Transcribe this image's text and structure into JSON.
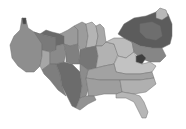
{
  "map": {
    "type": "cartogram",
    "subject": "contiguous United States",
    "color_scheme": "grayscale",
    "background": "#ffffff",
    "border_color": "#6e6e6e",
    "legend": null,
    "title": null,
    "regions": [
      {
        "name": "west-coast",
        "fill": "#8e8e8e",
        "points": "10,45 14,36 20,30 22,18 26,20 28,28 34,32 40,34 42,44 42,56 40,66 34,72 26,72 18,66 12,58"
      },
      {
        "name": "wa-tip",
        "fill": "#4a4a4a",
        "points": "22,18 26,18 26,24 23,24"
      },
      {
        "name": "northwest-interior",
        "fill": "#7a7a7a",
        "points": "34,32 40,34 48,36 56,38 56,50 50,52 42,50 42,44"
      },
      {
        "name": "nevada-utah",
        "fill": "#a6a6a6",
        "points": "42,50 50,52 50,64 42,70 40,66 42,56"
      },
      {
        "name": "mountain-north",
        "fill": "#6a6a6a",
        "points": "40,34 46,30 52,32 60,34 64,36 64,44 56,46 56,38 48,36"
      },
      {
        "name": "mountain-central",
        "fill": "#8a8a8a",
        "points": "50,52 56,50 56,46 64,44 66,54 64,62 56,64 50,64"
      },
      {
        "name": "southwest",
        "fill": "#7e7e7e",
        "points": "42,70 50,64 56,64 60,74 62,86 66,96 58,90 50,80 44,74"
      },
      {
        "name": "texas",
        "fill": "#6c6c6c",
        "points": "56,64 64,62 72,64 80,72 82,86 80,98 76,108 72,106 68,98 62,86 60,74"
      },
      {
        "name": "plains-north",
        "fill": "#9a9a9a",
        "points": "60,34 68,30 74,26 78,30 78,44 70,46 64,44 64,36"
      },
      {
        "name": "plains-central",
        "fill": "#808080",
        "points": "64,44 70,46 78,44 80,56 78,64 72,64 66,62 66,54"
      },
      {
        "name": "minnesota-iowa",
        "fill": "#9c9c9c",
        "points": "74,26 82,22 86,24 88,36 86,48 80,50 78,44 78,30"
      },
      {
        "name": "wisconsin",
        "fill": "#b4b4b4",
        "points": "86,24 92,22 96,26 98,36 96,46 88,48 86,48 88,36"
      },
      {
        "name": "illinois",
        "fill": "#767676",
        "points": "80,50 86,48 96,46 98,56 96,68 88,70 80,64 78,64 80,56"
      },
      {
        "name": "michigan",
        "fill": "#a8a8a8",
        "points": "96,26 100,24 104,28 106,42 102,46 96,46 98,36"
      },
      {
        "name": "indiana-ohio",
        "fill": "#b2b2b2",
        "points": "96,46 102,46 106,42 114,44 118,54 114,64 104,66 96,68 98,56"
      },
      {
        "name": "pennsylvania-ny-west",
        "fill": "#bcbcbc",
        "points": "106,42 114,38 124,38 132,42 134,52 126,58 118,56 114,44"
      },
      {
        "name": "northeast",
        "fill": "#5c5c5c",
        "points": "118,34 124,24 134,18 146,16 156,12 162,10 168,14 172,24 172,36 170,44 162,48 152,48 140,46 132,42 124,38"
      },
      {
        "name": "new-england-top",
        "fill": "#b8b8b8",
        "points": "156,12 160,8 166,10 168,16 162,20 156,18"
      },
      {
        "name": "ny-east",
        "fill": "#6e6e6e",
        "points": "140,24 152,22 160,26 162,36 156,40 146,38 140,32"
      },
      {
        "name": "mid-atlantic",
        "fill": "#868686",
        "points": "132,42 140,46 152,48 162,48 166,56 160,62 150,62 140,58 134,52"
      },
      {
        "name": "dc-md",
        "fill": "#3e3e3e",
        "points": "136,56 142,54 146,58 142,64 136,62"
      },
      {
        "name": "virginia",
        "fill": "#c2c2c2",
        "points": "118,56 126,58 134,52 136,56 136,62 142,64 150,62 156,66 152,72 140,74 126,74 116,72 114,64"
      },
      {
        "name": "kentucky-tennessee",
        "fill": "#a2a2a2",
        "points": "88,70 96,68 104,66 114,64 116,72 126,74 140,74 152,72 154,78 140,80 120,80 100,80 86,78"
      },
      {
        "name": "arkansas-louisiana",
        "fill": "#8c8c8c",
        "points": "80,64 88,70 86,78 88,90 86,96 80,98 82,86 80,72"
      },
      {
        "name": "deep-south",
        "fill": "#9e9e9e",
        "points": "86,78 100,80 120,80 122,92 116,94 104,94 94,96 88,96 88,90"
      },
      {
        "name": "carolinas-georgia",
        "fill": "#b0b0b0",
        "points": "120,80 140,80 154,78 156,84 146,92 134,94 122,92"
      },
      {
        "name": "florida",
        "fill": "#b6b6b6",
        "points": "122,92 134,94 140,96 144,102 148,112 146,118 142,118 138,110 134,102 126,98 116,98 116,94"
      },
      {
        "name": "louisiana-coast",
        "fill": "#929292",
        "points": "76,108 80,98 86,96 94,96 96,100 88,104 80,110"
      }
    ]
  }
}
